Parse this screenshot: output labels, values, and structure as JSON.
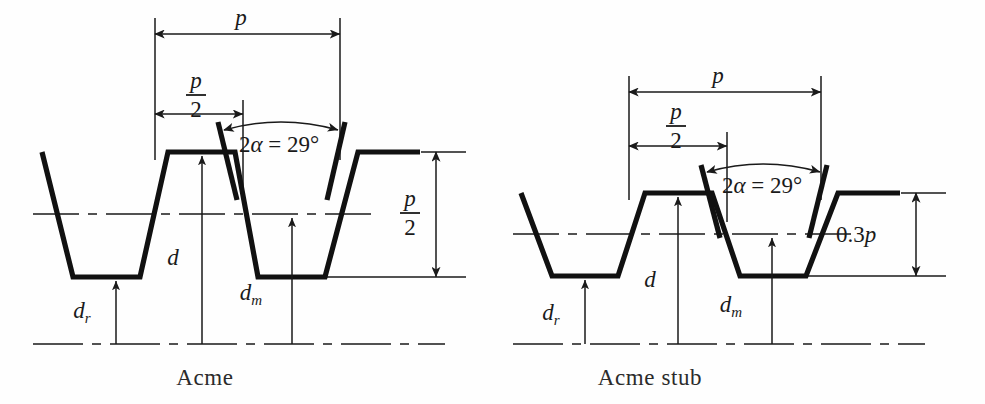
{
  "figure": {
    "stroke_color": "#111111",
    "thin_color": "#1a1a1a",
    "background": "#fefefe"
  },
  "diagrams": [
    {
      "id": "acme",
      "caption": "Acme",
      "caption_x": 205,
      "caption_y": 385,
      "geometry": {
        "crest_y": 152,
        "pitch_y": 214,
        "root_y": 277,
        "axis_y": 344,
        "profile_points": "42,152 73,277 140,277 168,152 235,152 258,277 325,277 358,152 420,152",
        "flank_slope_dx": 31,
        "crest_flat_width": 67,
        "root_flat_width": 67
      },
      "pitch_line": {
        "x1": 33,
        "x2": 372,
        "y": 214,
        "dash": "46,9,9,9"
      },
      "axis_line": {
        "x1": 33,
        "x2": 445,
        "y": 344,
        "dash": "50,9,9,9"
      },
      "crest_ref_line": {
        "x1": 421,
        "x2": 466,
        "y": 152
      },
      "root_ref_line": {
        "x1": 325,
        "x2": 466,
        "y": 277
      },
      "dimensions": [
        {
          "name": "pitch",
          "label": "p",
          "type": "horizontal",
          "label_style": "italic",
          "x1": 155,
          "x2": 340,
          "y": 34,
          "label_x": 241,
          "label_y": 25
        },
        {
          "name": "half-pitch",
          "label_numerator": "p",
          "label_denominator": "2",
          "type": "horizontal-fraction",
          "x1": 155,
          "x2": 243,
          "y": 114,
          "label_x": 196,
          "num_y": 88,
          "bar_y": 95,
          "den_y": 117
        },
        {
          "name": "thread-height",
          "label_numerator": "p",
          "label_denominator": "2",
          "type": "vertical-fraction",
          "x": 436,
          "y1": 152,
          "y2": 277,
          "label_x": 410,
          "num_y": 206,
          "bar_y": 213,
          "den_y": 235
        }
      ],
      "ext_lines": [
        {
          "name": "pitch-left-ext",
          "x": 155,
          "y1": 18,
          "y2": 160
        },
        {
          "name": "pitch-right-ext",
          "x": 340,
          "y1": 18,
          "y2": 160
        },
        {
          "name": "half-pitch-ext",
          "x": 243,
          "y1": 100,
          "y2": 192
        }
      ],
      "angle": {
        "label": "2α = 29°",
        "label_x": 239,
        "label_y": 152,
        "arc_start_x": 224,
        "arc_start_y": 130,
        "arc_end_x": 338,
        "arc_end_y": 130,
        "arc_ctrl_x": 281,
        "arc_ctrl_y": 114,
        "flank_left": {
          "x1": 218,
          "y1": 122,
          "x2": 237,
          "y2": 200
        },
        "flank_right": {
          "x1": 345,
          "y1": 122,
          "x2": 327,
          "y2": 200
        }
      },
      "leaders": [
        {
          "name": "dr",
          "label": "d",
          "subscript": "r",
          "x": 116,
          "y_tip": 281,
          "y_base": 344,
          "label_x": 82,
          "label_y": 318
        },
        {
          "name": "d",
          "label": "d",
          "subscript": "",
          "x": 202,
          "y_tip": 156,
          "y_base": 344,
          "label_x": 173,
          "label_y": 265
        },
        {
          "name": "dm",
          "label": "d",
          "subscript": "m",
          "x": 292,
          "y_tip": 218,
          "y_base": 344,
          "label_x": 251,
          "label_y": 300
        }
      ]
    },
    {
      "id": "acme-stub",
      "caption": "Acme stub",
      "caption_x": 650,
      "caption_y": 385,
      "geometry": {
        "crest_y": 193,
        "pitch_y": 234,
        "root_y": 276,
        "axis_y": 344,
        "profile_points": "521,193 552,276 618,276 645,193 712,193 740,276 806,276 838,193 900,193",
        "flank_slope_dx": 31,
        "crest_flat_width": 67,
        "root_flat_width": 66
      },
      "pitch_line": {
        "x1": 513,
        "x2": 855,
        "y": 234,
        "dash": "46,9,9,9"
      },
      "axis_line": {
        "x1": 513,
        "x2": 925,
        "y": 344,
        "dash": "50,9,9,9"
      },
      "crest_ref_line": {
        "x1": 901,
        "x2": 946,
        "y": 193
      },
      "root_ref_line": {
        "x1": 806,
        "x2": 946,
        "y": 276
      },
      "dimensions": [
        {
          "name": "pitch",
          "label": "p",
          "type": "horizontal",
          "label_style": "italic",
          "x1": 629,
          "x2": 821,
          "y": 92,
          "label_x": 718,
          "label_y": 83
        },
        {
          "name": "half-pitch",
          "label_numerator": "p",
          "label_denominator": "2",
          "type": "horizontal-fraction",
          "x1": 629,
          "x2": 727,
          "y": 146,
          "label_x": 676,
          "num_y": 119,
          "bar_y": 126,
          "den_y": 148
        },
        {
          "name": "thread-height",
          "label": "0.3p",
          "type": "vertical",
          "label_style": "mixed",
          "x": 916,
          "y1": 193,
          "y2": 276,
          "label_x": 856,
          "label_y": 242
        }
      ],
      "ext_lines": [
        {
          "name": "pitch-left-ext",
          "x": 629,
          "y1": 76,
          "y2": 200
        },
        {
          "name": "pitch-right-ext",
          "x": 821,
          "y1": 76,
          "y2": 200
        },
        {
          "name": "half-pitch-ext",
          "x": 727,
          "y1": 132,
          "y2": 222
        }
      ],
      "angle": {
        "label": "2α = 29°",
        "label_x": 722,
        "label_y": 193,
        "arc_start_x": 707,
        "arc_start_y": 172,
        "arc_end_x": 820,
        "arc_end_y": 172,
        "arc_ctrl_x": 763,
        "arc_ctrl_y": 156,
        "flank_left": {
          "x1": 701,
          "y1": 165,
          "x2": 720,
          "y2": 238
        },
        "flank_right": {
          "x1": 827,
          "y1": 165,
          "x2": 809,
          "y2": 238
        }
      },
      "leaders": [
        {
          "name": "dr",
          "label": "d",
          "subscript": "r",
          "x": 585,
          "y_tip": 280,
          "y_base": 344,
          "label_x": 551,
          "label_y": 320
        },
        {
          "name": "d",
          "label": "d",
          "subscript": "",
          "x": 678,
          "y_tip": 197,
          "y_base": 344,
          "label_x": 650,
          "label_y": 287
        },
        {
          "name": "dm",
          "label": "d",
          "subscript": "m",
          "x": 772,
          "y_tip": 238,
          "y_base": 344,
          "label_x": 731,
          "label_y": 312
        }
      ]
    }
  ],
  "chart_data": {
    "type": "diagram",
    "annotations": [
      "p",
      "p/2",
      "2α = 29°",
      "0.3p",
      "d",
      "d_r",
      "d_m"
    ],
    "captions": [
      "Acme",
      "Acme stub"
    ],
    "thread_angle_deg": 29,
    "acme_thread_height": "p/2",
    "stub_thread_height": "0.3p"
  }
}
